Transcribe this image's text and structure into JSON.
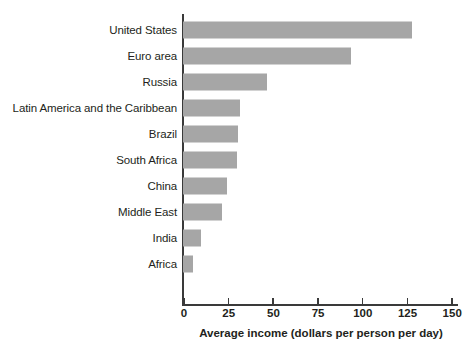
{
  "chart_data": {
    "type": "bar",
    "orientation": "horizontal",
    "title": "",
    "subtitle": "",
    "xlabel": "Average income (dollars per person per day)",
    "ylabel": "",
    "categories": [
      "United States",
      "Euro area",
      "Russia",
      "Latin America and the Caribbean",
      "Brazil",
      "South Africa",
      "China",
      "Middle East",
      "India",
      "Africa"
    ],
    "values": [
      128,
      94,
      47,
      32,
      31,
      30,
      24.5,
      22,
      10,
      5.5
    ],
    "xlim": [
      0,
      165
    ],
    "xticks": [
      0,
      25,
      50,
      75,
      100,
      125,
      150
    ],
    "xtick_labels": [
      "0",
      "25",
      "50",
      "75",
      "100",
      "125",
      "150"
    ],
    "grid": false,
    "legend": null,
    "bar_color": "#a6a6a6",
    "axis_color": "#3a3a3a",
    "text_color": "#231f20"
  },
  "footer": {
    "cut_off_text": ""
  }
}
